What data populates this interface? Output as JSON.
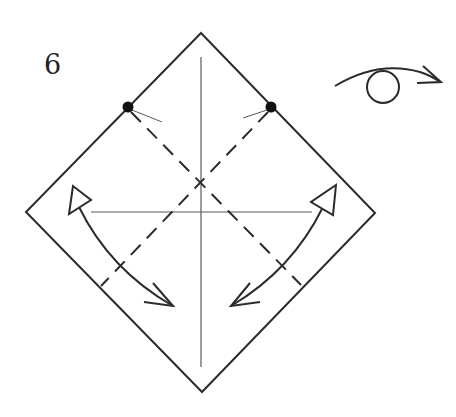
{
  "step": {
    "number": "6"
  },
  "colors": {
    "line": "#2b2b2b",
    "crease": "#5a5a5a",
    "background": "#ffffff"
  },
  "symbols": {
    "turn_over": "turn-over-icon",
    "valley_fold": "valley-fold-line",
    "fold_arrow": "fold-and-unfold-arrow",
    "reference_point": "dot-marker"
  }
}
